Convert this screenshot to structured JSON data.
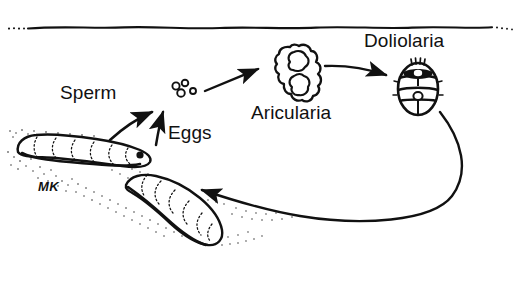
{
  "figure": {
    "width": 518,
    "height": 282,
    "background_color": "#ffffff",
    "ink_color": "#111111"
  },
  "labels": {
    "sperm": "Sperm",
    "eggs": "Eggs",
    "auricularia": "Aricularia",
    "doliolaria": "Doliolaria",
    "madreporite": "MK"
  },
  "elements": {
    "water_surface": "water-surface-line",
    "egg_cluster": "egg-cluster",
    "auricularia_larva": "auricularia-larva",
    "doliolaria_larva": "doliolaria-larva",
    "adult_upper": "adult-sea-cucumber-upper",
    "adult_lower": "adult-sea-cucumber-lower",
    "substrate": "stippled-substrate"
  },
  "arrows": [
    {
      "name": "sperm-arrow",
      "from": "adult-sea-cucumber-upper",
      "to": "egg-cluster"
    },
    {
      "name": "eggs-arrow",
      "from": "adult-sea-cucumber-lower",
      "to": "egg-cluster"
    },
    {
      "name": "eggs-to-auricularia-arrow",
      "from": "egg-cluster",
      "to": "auricularia-larva"
    },
    {
      "name": "auricularia-to-doliolaria-arrow",
      "from": "auricularia-larva",
      "to": "doliolaria-larva"
    },
    {
      "name": "doliolaria-to-adult-arrow",
      "from": "doliolaria-larva",
      "to": "adult-sea-cucumber-lower"
    }
  ]
}
